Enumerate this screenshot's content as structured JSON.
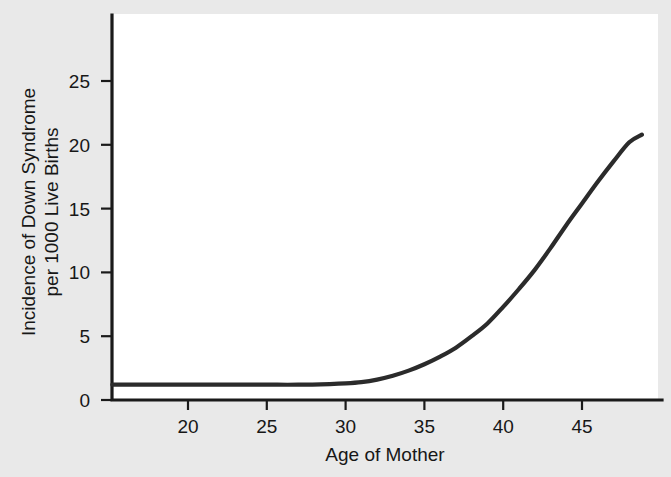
{
  "chart_data": {
    "type": "line",
    "title": "",
    "xlabel": "Age of Mother",
    "ylabel": "Incidence of Down Syndrome per 1000 Live Births",
    "ylabel_line1": "Incidence of Down Syndrome",
    "ylabel_line2": "per 1000 Live Births",
    "xlim": [
      15.2,
      49.5
    ],
    "ylim": [
      0,
      27.5
    ],
    "xticks": [
      20,
      25,
      30,
      35,
      40,
      45
    ],
    "xtick_labels": [
      "20",
      "25",
      "30",
      "35",
      "40",
      "45"
    ],
    "yticks": [
      0,
      5,
      10,
      15,
      20,
      25
    ],
    "ytick_labels": [
      "0",
      "5",
      "10",
      "15",
      "20",
      "25"
    ],
    "grid": false,
    "legend": null,
    "series": [
      {
        "name": "Incidence of Down Syndrome",
        "color": "#2b2b2b",
        "x": [
          15.2,
          17,
          19,
          21,
          23,
          25,
          27,
          29,
          30,
          31,
          32,
          33,
          34,
          35,
          36,
          37,
          38,
          39,
          40,
          41,
          42,
          43,
          44,
          45,
          46,
          47,
          48,
          48.8
        ],
        "y": [
          1.2,
          1.2,
          1.2,
          1.2,
          1.2,
          1.2,
          1.2,
          1.25,
          1.3,
          1.4,
          1.6,
          1.9,
          2.3,
          2.8,
          3.4,
          4.1,
          5.0,
          6.0,
          7.3,
          8.7,
          10.2,
          11.9,
          13.7,
          15.4,
          17.1,
          18.7,
          20.2,
          20.8
        ]
      }
    ]
  },
  "figure": {
    "background_color": "#e9e9e9",
    "plot_background_color": "#ffffff",
    "axis_color": "#1a1a1a"
  }
}
